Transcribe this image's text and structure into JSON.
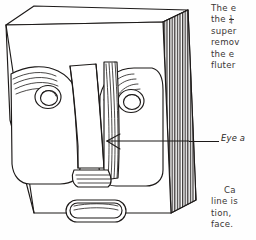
{
  "page": {
    "kind": "scanned-book-page-fragment",
    "background_color": "#fefefe",
    "ink_color": "#231f1e"
  },
  "figure": {
    "parts": [
      "block-top-face",
      "block-front-face",
      "block-right-side-face",
      "left-eye",
      "right-eye",
      "nose-ridge",
      "mouth",
      "left-cheek-flute",
      "right-cheek-flute"
    ]
  },
  "callout": {
    "label": "Eye a",
    "leader_line": "leader-line-to-nose-side"
  },
  "paragraph_top": {
    "lines": [
      "The e",
      "the ",
      "super",
      "remov",
      "the  e",
      "fluter"
    ],
    "fraction_line_index": 1,
    "fraction": {
      "numerator": "1",
      "denominator": "4"
    }
  },
  "paragraph_bottom": {
    "lines": [
      "Ca",
      "line is",
      "tion,",
      "face."
    ],
    "indent_line_index": 0
  }
}
